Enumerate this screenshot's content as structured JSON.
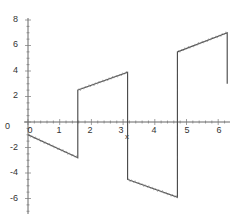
{
  "chart_data": {
    "type": "line",
    "title": "",
    "xlabel": "x",
    "ylabel": "",
    "xlim": [
      0,
      6.3
    ],
    "ylim": [
      -7,
      8
    ],
    "grid": false,
    "legend": null,
    "x_ticks": [
      "0",
      "1",
      "2",
      "3",
      "4",
      "5",
      "6"
    ],
    "y_ticks": [
      "8",
      "6",
      "4",
      "2",
      "0",
      "-2",
      "-4",
      "-6"
    ],
    "series": [
      {
        "name": "f(x)",
        "description": "Piecewise linear square-wave-plus-ramp with jumps at pi/2, pi, 3pi/2, 2pi; small Gibbs-like ripple near jumps",
        "points": [
          [
            0.0,
            -1.0
          ],
          [
            1.571,
            -2.8
          ],
          [
            1.571,
            2.5
          ],
          [
            3.142,
            3.9
          ],
          [
            3.142,
            -4.5
          ],
          [
            4.712,
            -5.9
          ],
          [
            4.712,
            5.5
          ],
          [
            6.283,
            7.0
          ],
          [
            6.283,
            3.0
          ]
        ]
      }
    ],
    "colors": {
      "line": "#444444",
      "axis": "#555555",
      "background": "#ffffff"
    }
  }
}
